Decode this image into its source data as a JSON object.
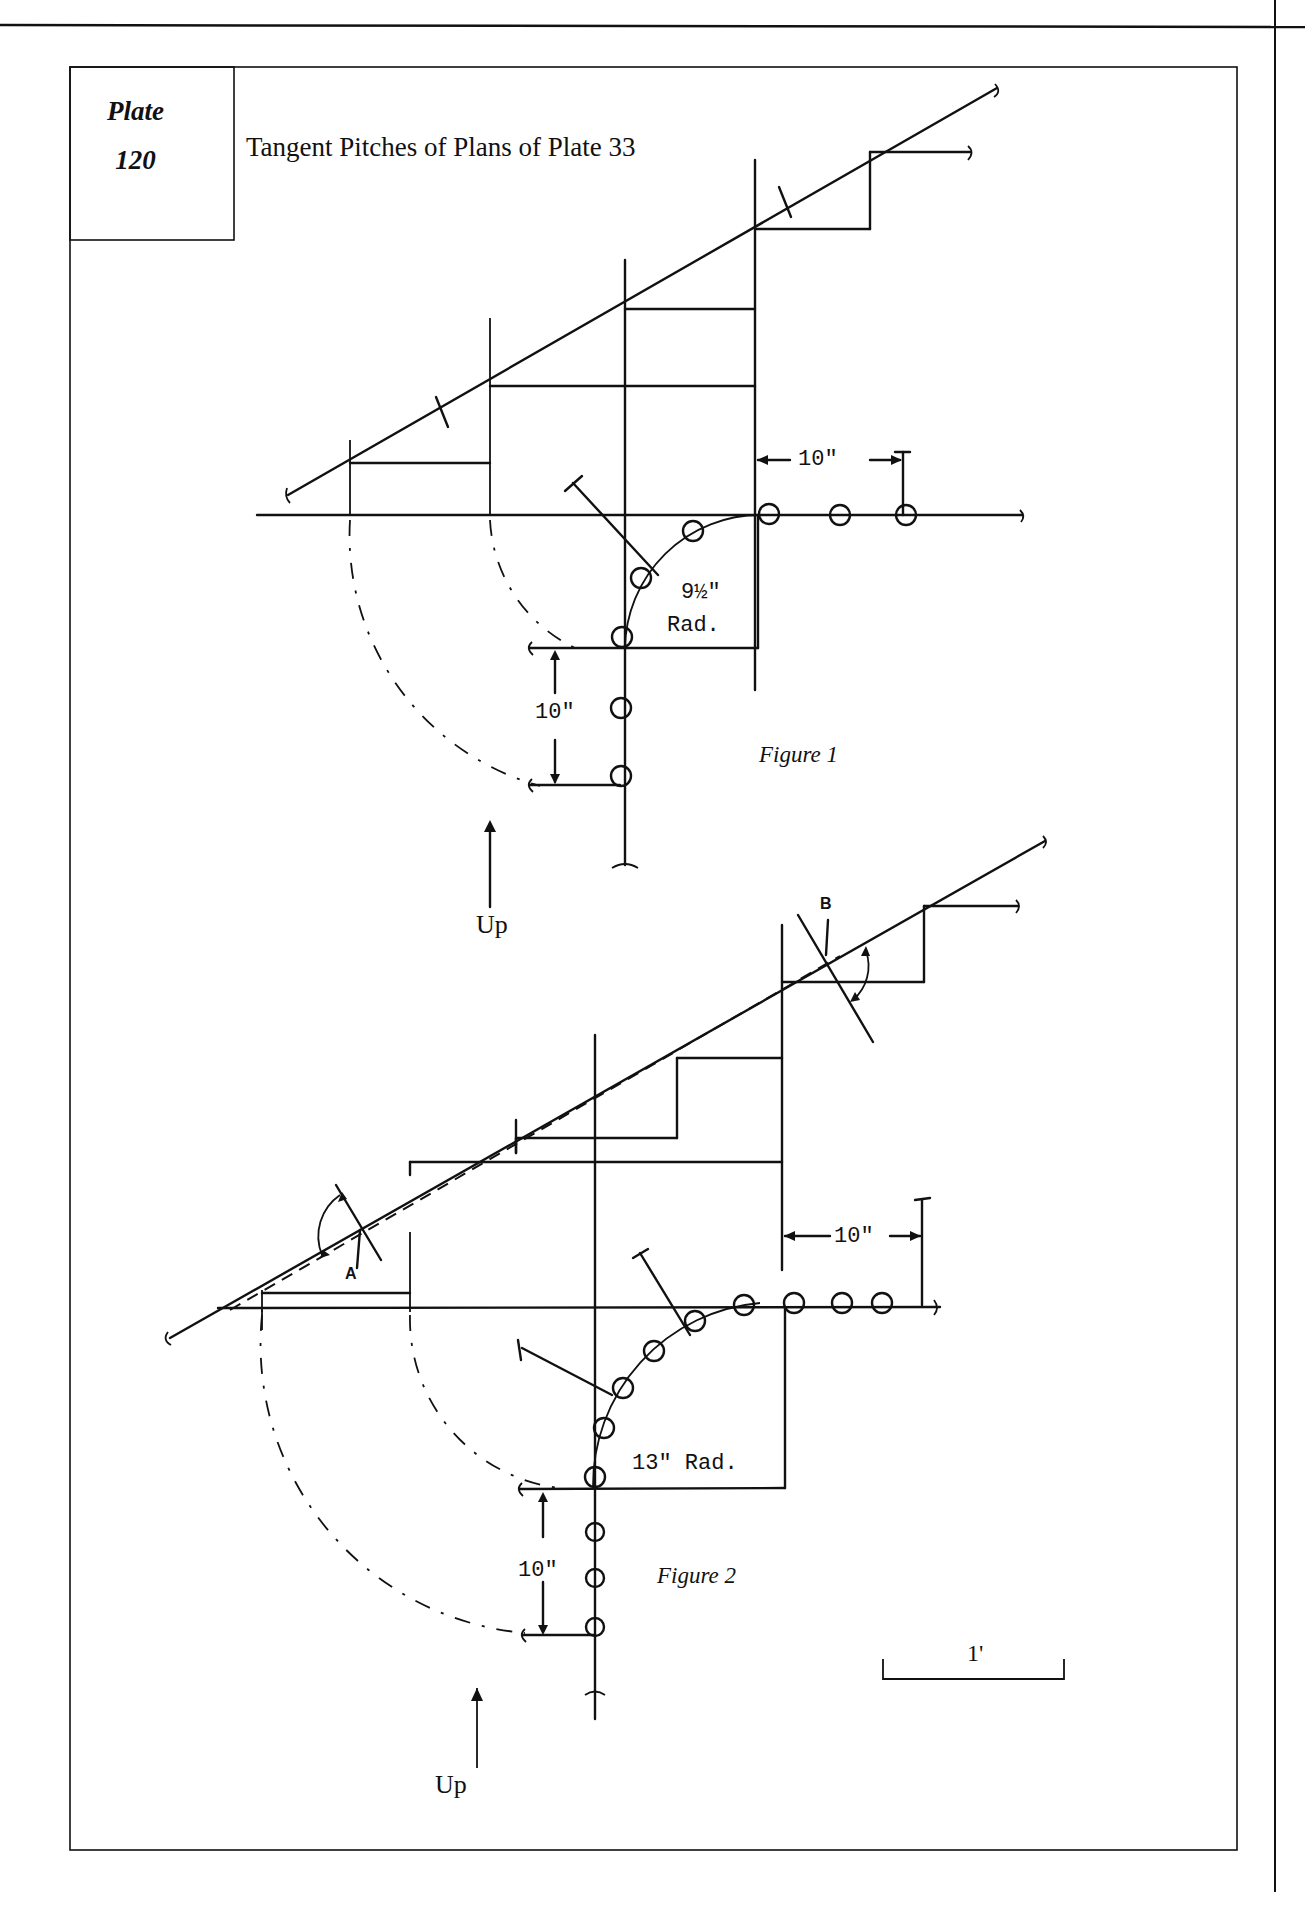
{
  "plate": {
    "label": "Plate",
    "number": "120"
  },
  "title": "Tangent Pitches of Plans of Plate 33",
  "figure1": {
    "caption": "Figure 1",
    "radius_value": "9½\"",
    "radius_unit": "Rad.",
    "dim_horizontal": "10\"",
    "dim_vertical": "10\"",
    "direction_label": "Up"
  },
  "figure2": {
    "caption": "Figure 2",
    "radius_label": "13\" Rad.",
    "dim_horizontal": "10\"",
    "dim_vertical": "10\"",
    "direction_label": "Up",
    "point_a": "A",
    "point_b": "B"
  },
  "scale_bar": {
    "label": "1'"
  },
  "colors": {
    "ink": "#111111",
    "paper": "#ffffff"
  }
}
